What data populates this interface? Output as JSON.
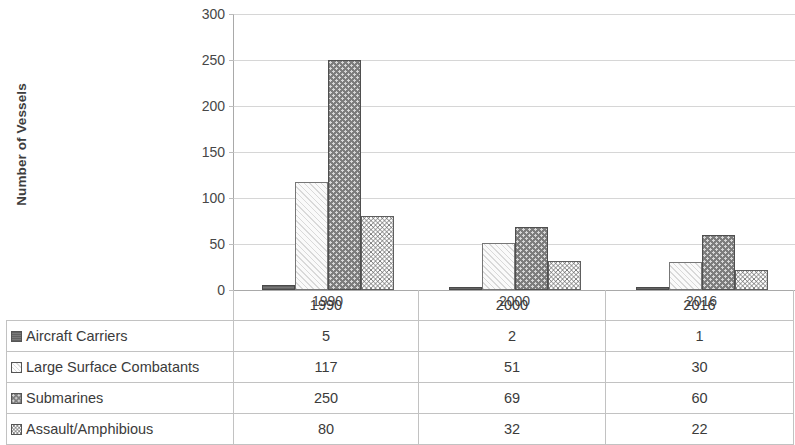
{
  "chart_data": {
    "type": "bar",
    "title": "",
    "xlabel": "",
    "ylabel": "Number of Vessels",
    "categories": [
      "1990",
      "2000",
      "2016"
    ],
    "ylim": [
      0,
      300
    ],
    "ytick_step": 50,
    "yticks": [
      300,
      250,
      200,
      150,
      100,
      50,
      0
    ],
    "grid": true,
    "legend_position": "data-table",
    "series": [
      {
        "name": "Aircraft Carriers",
        "values": [
          5,
          2,
          1
        ],
        "pattern": "solid-dark-gray",
        "color": "#6f6f6f"
      },
      {
        "name": "Large Surface Combatants",
        "values": [
          117,
          51,
          30
        ],
        "pattern": "light-diagonal-hatch",
        "color": "#f4f4f4"
      },
      {
        "name": "Submarines",
        "values": [
          250,
          69,
          60
        ],
        "pattern": "gray-with-light-dots",
        "color": "#7d7d7d"
      },
      {
        "name": "Assault/Amphibious",
        "values": [
          80,
          32,
          22
        ],
        "pattern": "white-with-zigzag-waves",
        "color": "#ffffff"
      }
    ]
  },
  "axis": {
    "y_title": "Number of Vessels",
    "y_labels": [
      "300",
      "250",
      "200",
      "150",
      "100",
      "50",
      "0"
    ]
  },
  "categories": [
    {
      "label": "1990"
    },
    {
      "label": "2000"
    },
    {
      "label": "2016"
    }
  ],
  "table": {
    "header": {
      "blank": "",
      "columns": [
        "1990",
        "2000",
        "2016"
      ]
    },
    "rows": [
      {
        "swatch": "solid-swatch-icon",
        "label": "Aircraft Carriers",
        "values": [
          "5",
          "2",
          "1"
        ]
      },
      {
        "swatch": "hatch-swatch-icon",
        "label": "Large Surface Combatants",
        "values": [
          "117",
          "51",
          "30"
        ]
      },
      {
        "swatch": "dots-swatch-icon",
        "label": "Submarines",
        "values": [
          "250",
          "69",
          "60"
        ]
      },
      {
        "swatch": "wave-swatch-icon",
        "label": "Assault/Amphibious",
        "values": [
          "80",
          "32",
          "22"
        ]
      }
    ]
  }
}
